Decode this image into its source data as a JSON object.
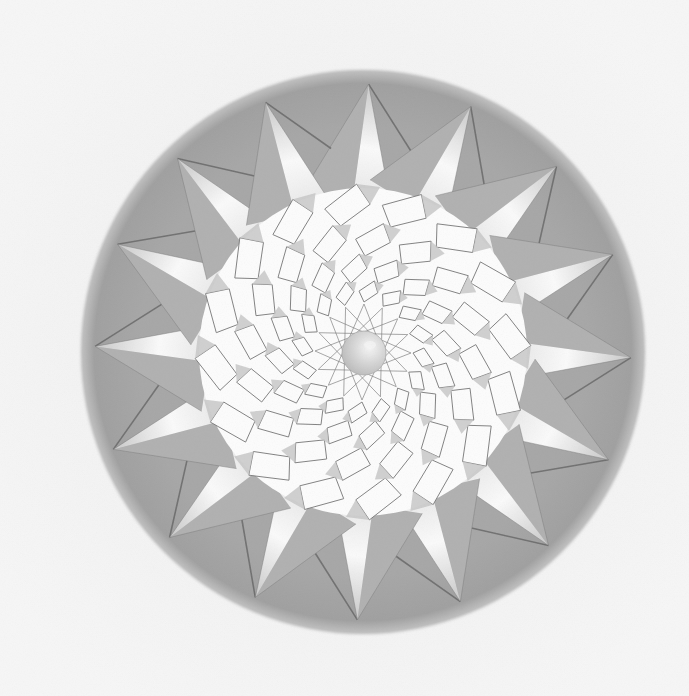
{
  "artwork": {
    "title": "Sixteen-pointed star mandala drawing",
    "description": "Pencil drawing of a 16-pointed star inside a grey circle, with a pinwheel of square tiles spiraling toward a central pearl",
    "medium": "graphite on paper",
    "colors": {
      "paper": "#f3f3f3",
      "rim": "#a3a3a3",
      "rim_edge": "#b8b8b8",
      "point_light": "#fbfbfb",
      "point_shade": "#b0b0b0",
      "line": "#7a7a7a",
      "dark_line": "#5e5e5e",
      "tile": "#fdfdfd",
      "tile_shade": "#c4c4c4",
      "pearl": "#d9d9d9",
      "pearl_highlight": "#f5f5f5"
    },
    "geometry": {
      "center": [
        363,
        352
      ],
      "rim_radius": 280,
      "points": 16,
      "tip_radius": 268,
      "base_radius_a": 172,
      "base_radius_b": 150,
      "rotation_deg": 1.2,
      "tile_rings": [
        {
          "r_in": 128,
          "r_out": 168,
          "offset": 0.5,
          "twist": 0.35
        },
        {
          "r_in": 96,
          "r_out": 130,
          "offset": 0.0,
          "twist": 0.35
        },
        {
          "r_in": 70,
          "r_out": 98,
          "offset": 0.5,
          "twist": 0.35
        },
        {
          "r_in": 50,
          "r_out": 72,
          "offset": 0.0,
          "twist": 0.35
        }
      ],
      "inner_star_radius": 48,
      "inner_star_step": 6,
      "pearl_radius": 22
    }
  }
}
